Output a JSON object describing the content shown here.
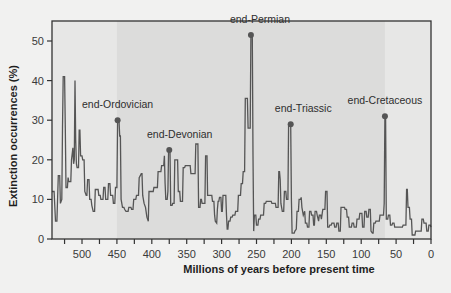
{
  "chart_data": {
    "type": "line",
    "title": "",
    "xlabel": "Millions of years before present time",
    "ylabel": "Extinction occurrences (%)",
    "xlim": [
      543,
      0
    ],
    "ylim": [
      0,
      55
    ],
    "x_reversed": true,
    "grid": false,
    "legend": null,
    "x_ticks": [
      500,
      450,
      400,
      350,
      300,
      250,
      200,
      150,
      100,
      50,
      0
    ],
    "x_minor_ticks": [
      525,
      475,
      425,
      375,
      325,
      275,
      225,
      175,
      125,
      75,
      25
    ],
    "y_ticks": [
      0,
      10,
      20,
      30,
      40,
      50
    ],
    "shaded_region": {
      "from": 450,
      "to": 66,
      "color": "#dcdcdb"
    },
    "series": [
      {
        "name": "Extinction occurrences",
        "color": "#555555",
        "step": true,
        "points": [
          [
            543,
            12
          ],
          [
            540,
            12
          ],
          [
            538,
            4.5
          ],
          [
            536,
            4.5
          ],
          [
            534,
            16
          ],
          [
            532,
            16
          ],
          [
            531,
            9
          ],
          [
            529,
            10
          ],
          [
            528,
            28
          ],
          [
            527,
            41
          ],
          [
            525,
            41
          ],
          [
            524,
            28
          ],
          [
            523,
            13
          ],
          [
            521,
            13
          ],
          [
            520,
            15.5
          ],
          [
            519,
            14.5
          ],
          [
            516,
            14.5
          ],
          [
            515,
            20
          ],
          [
            513,
            23
          ],
          [
            512,
            19
          ],
          [
            511,
            20
          ],
          [
            510,
            40
          ],
          [
            509,
            25
          ],
          [
            508,
            19
          ],
          [
            507,
            18
          ],
          [
            505,
            18
          ],
          [
            504,
            27.5
          ],
          [
            503,
            27.5
          ],
          [
            502,
            21
          ],
          [
            500,
            21
          ],
          [
            499,
            20
          ],
          [
            497,
            20
          ],
          [
            496,
            12
          ],
          [
            494,
            11
          ],
          [
            493,
            11
          ],
          [
            492,
            15
          ],
          [
            490,
            15
          ],
          [
            489,
            10
          ],
          [
            487,
            10
          ],
          [
            486,
            8.5
          ],
          [
            484,
            7
          ],
          [
            482,
            7
          ],
          [
            481,
            12.5
          ],
          [
            477,
            12.5
          ],
          [
            476,
            11
          ],
          [
            474,
            11
          ],
          [
            473,
            10
          ],
          [
            470,
            10
          ],
          [
            469,
            13
          ],
          [
            467,
            13
          ],
          [
            466,
            10
          ],
          [
            463,
            10
          ],
          [
            462,
            14
          ],
          [
            460,
            14
          ],
          [
            459,
            11
          ],
          [
            456,
            11
          ],
          [
            455,
            9
          ],
          [
            453,
            9
          ],
          [
            452,
            13
          ],
          [
            450,
            13
          ],
          [
            449,
            30
          ],
          [
            447,
            30
          ],
          [
            446,
            26
          ],
          [
            445,
            26
          ],
          [
            444,
            10
          ],
          [
            442,
            8
          ],
          [
            440,
            8
          ],
          [
            439,
            7.5
          ],
          [
            437,
            7
          ],
          [
            434,
            7
          ],
          [
            433,
            8
          ],
          [
            430,
            8
          ],
          [
            429,
            7.5
          ],
          [
            427,
            7.5
          ],
          [
            426,
            10
          ],
          [
            423,
            10
          ],
          [
            422,
            11
          ],
          [
            419,
            11
          ],
          [
            418,
            15.5
          ],
          [
            415,
            16.5
          ],
          [
            414,
            16.5
          ],
          [
            413,
            11
          ],
          [
            411,
            9
          ],
          [
            409,
            8
          ],
          [
            407,
            5.5
          ],
          [
            405,
            4.5
          ],
          [
            404,
            12
          ],
          [
            401,
            12
          ],
          [
            400,
            12
          ],
          [
            398,
            12
          ],
          [
            397,
            13
          ],
          [
            392,
            13
          ],
          [
            391,
            17
          ],
          [
            387,
            17
          ],
          [
            386,
            18.5
          ],
          [
            383,
            18.5
          ],
          [
            382,
            21
          ],
          [
            381,
            14
          ],
          [
            380,
            10
          ],
          [
            378,
            10
          ],
          [
            377,
            12
          ],
          [
            376,
            22.5
          ],
          [
            374,
            22.5
          ],
          [
            373,
            8.5
          ],
          [
            371,
            8.5
          ],
          [
            370,
            9
          ],
          [
            368,
            9
          ],
          [
            367,
            20
          ],
          [
            363,
            20
          ],
          [
            362,
            12
          ],
          [
            360,
            12
          ],
          [
            359,
            9.5
          ],
          [
            356,
            9.5
          ],
          [
            355,
            18
          ],
          [
            353,
            18
          ],
          [
            352,
            18.5
          ],
          [
            345,
            18.5
          ],
          [
            344,
            16.5
          ],
          [
            338,
            16.5
          ],
          [
            337,
            24
          ],
          [
            334,
            24
          ],
          [
            333,
            8
          ],
          [
            331,
            8
          ],
          [
            330,
            10
          ],
          [
            329,
            10
          ],
          [
            328,
            9
          ],
          [
            324,
            9
          ],
          [
            323,
            21
          ],
          [
            321,
            21
          ],
          [
            320,
            11
          ],
          [
            314,
            11
          ],
          [
            313,
            9.5
          ],
          [
            311,
            9.5
          ],
          [
            310,
            6
          ],
          [
            309,
            4.5
          ],
          [
            307,
            4
          ],
          [
            306,
            7.5
          ],
          [
            305,
            9.5
          ],
          [
            304,
            9.5
          ],
          [
            303,
            10.5
          ],
          [
            301,
            10.5
          ],
          [
            300,
            7
          ],
          [
            299,
            7
          ],
          [
            298,
            11
          ],
          [
            294,
            11
          ],
          [
            293,
            6
          ],
          [
            292,
            2.5
          ],
          [
            291,
            2.5
          ],
          [
            290,
            4.5
          ],
          [
            288,
            4.5
          ],
          [
            287,
            5.5
          ],
          [
            285,
            5.5
          ],
          [
            284,
            6
          ],
          [
            281,
            6
          ],
          [
            280,
            7
          ],
          [
            277,
            7
          ],
          [
            276,
            11
          ],
          [
            273,
            11
          ],
          [
            272,
            14
          ],
          [
            270,
            14
          ],
          [
            269,
            17
          ],
          [
            267,
            17
          ],
          [
            266,
            35.5
          ],
          [
            263,
            35.5
          ],
          [
            262,
            28
          ],
          [
            259,
            28
          ],
          [
            258,
            51.5
          ],
          [
            256,
            51.5
          ],
          [
            255,
            21
          ],
          [
            254,
            2
          ],
          [
            253,
            6
          ],
          [
            251,
            6
          ],
          [
            250,
            3.5
          ],
          [
            248,
            3.5
          ],
          [
            247,
            5
          ],
          [
            245,
            5
          ],
          [
            244,
            6
          ],
          [
            240,
            6
          ],
          [
            239,
            9
          ],
          [
            237,
            9
          ],
          [
            236,
            9.5
          ],
          [
            229,
            9.5
          ],
          [
            228,
            9
          ],
          [
            223,
            9
          ],
          [
            222,
            8
          ],
          [
            219,
            8
          ],
          [
            218,
            17
          ],
          [
            217,
            17
          ],
          [
            216,
            15
          ],
          [
            215,
            9
          ],
          [
            213,
            7
          ],
          [
            211,
            7
          ],
          [
            210,
            12
          ],
          [
            208,
            12
          ],
          [
            207,
            10
          ],
          [
            205,
            10
          ],
          [
            204,
            29
          ],
          [
            202,
            29
          ],
          [
            201,
            29
          ],
          [
            200,
            10
          ],
          [
            199,
            1.5
          ],
          [
            196,
            1.5
          ],
          [
            195,
            2
          ],
          [
            193,
            2.5
          ],
          [
            192,
            7
          ],
          [
            190,
            7
          ],
          [
            189,
            10
          ],
          [
            187,
            10
          ],
          [
            186,
            10.5
          ],
          [
            185,
            8
          ],
          [
            183,
            6
          ],
          [
            181,
            7
          ],
          [
            180,
            4
          ],
          [
            178,
            4
          ],
          [
            177,
            3
          ],
          [
            175,
            3
          ],
          [
            174,
            7
          ],
          [
            172,
            7
          ],
          [
            171,
            6
          ],
          [
            169,
            6
          ],
          [
            168,
            3.5
          ],
          [
            167,
            3.5
          ],
          [
            166,
            7
          ],
          [
            164,
            7
          ],
          [
            163,
            6
          ],
          [
            161,
            4.5
          ],
          [
            160,
            6
          ],
          [
            158,
            6
          ],
          [
            157,
            5
          ],
          [
            155,
            7.5
          ],
          [
            152,
            7.5
          ],
          [
            151,
            12
          ],
          [
            149,
            12
          ],
          [
            148,
            3
          ],
          [
            146,
            3
          ],
          [
            145,
            3.5
          ],
          [
            143,
            3.5
          ],
          [
            142,
            4
          ],
          [
            139,
            4
          ],
          [
            138,
            3
          ],
          [
            136,
            3
          ],
          [
            135,
            4
          ],
          [
            133,
            4
          ],
          [
            132,
            2
          ],
          [
            130,
            2
          ],
          [
            129,
            8
          ],
          [
            124,
            8
          ],
          [
            123,
            7.5
          ],
          [
            121,
            7.5
          ],
          [
            120,
            5.5
          ],
          [
            118,
            5.5
          ],
          [
            117,
            3
          ],
          [
            114,
            3
          ],
          [
            113,
            4
          ],
          [
            111,
            4
          ],
          [
            110,
            3
          ],
          [
            107,
            3
          ],
          [
            106,
            5
          ],
          [
            103,
            5
          ],
          [
            102,
            6.5
          ],
          [
            99,
            6.5
          ],
          [
            98,
            3
          ],
          [
            96,
            3
          ],
          [
            95,
            7
          ],
          [
            93,
            7
          ],
          [
            92,
            5.5
          ],
          [
            90,
            5.5
          ],
          [
            89,
            7.5
          ],
          [
            87,
            7.5
          ],
          [
            86,
            2
          ],
          [
            84,
            1.5
          ],
          [
            83,
            1.5
          ],
          [
            82,
            4
          ],
          [
            80,
            4
          ],
          [
            79,
            4.5
          ],
          [
            76,
            4.5
          ],
          [
            75,
            4.5
          ],
          [
            74,
            4.5
          ],
          [
            73,
            6
          ],
          [
            68,
            6
          ],
          [
            67,
            9
          ],
          [
            66,
            31
          ],
          [
            65,
            31
          ],
          [
            64,
            5
          ],
          [
            62,
            5
          ],
          [
            61,
            6
          ],
          [
            59,
            6
          ],
          [
            58,
            3.5
          ],
          [
            56,
            3.5
          ],
          [
            55,
            4
          ],
          [
            53,
            4
          ],
          [
            52,
            3
          ],
          [
            41,
            3
          ],
          [
            40,
            3.5
          ],
          [
            36,
            3.5
          ],
          [
            35,
            12.5
          ],
          [
            34,
            12.5
          ],
          [
            33,
            8
          ],
          [
            31,
            8
          ],
          [
            30,
            5
          ],
          [
            28,
            5
          ],
          [
            27,
            1
          ],
          [
            23,
            1
          ],
          [
            22,
            2
          ],
          [
            14,
            2
          ],
          [
            13,
            5
          ],
          [
            11,
            5
          ],
          [
            10,
            4
          ],
          [
            7,
            4
          ],
          [
            6,
            2
          ],
          [
            4,
            2
          ],
          [
            3,
            3.5
          ],
          [
            1,
            3.5
          ],
          [
            0,
            3
          ]
        ]
      }
    ],
    "annotations": [
      {
        "label": "end-Ordovician",
        "x": 449,
        "y": 30,
        "label_x": 449,
        "label_y": 33
      },
      {
        "label": "end-Devonian",
        "x": 375,
        "y": 22.5,
        "label_x": 360,
        "label_y": 25.5
      },
      {
        "label": "end-Permian",
        "x": 258,
        "y": 51.5,
        "label_x": 245,
        "label_y": 54.5
      },
      {
        "label": "end-Triassic",
        "x": 201,
        "y": 29,
        "label_x": 183,
        "label_y": 32
      },
      {
        "label": "end-Cretaceous",
        "x": 66,
        "y": 31,
        "label_x": 66,
        "label_y": 34
      }
    ]
  }
}
